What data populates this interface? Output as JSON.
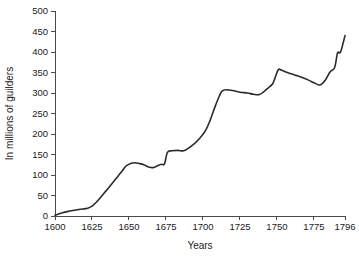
{
  "chart_data": {
    "type": "line",
    "title": "",
    "xlabel": "Years",
    "ylabel": "In millions of guilders",
    "xlim": [
      1600,
      1796
    ],
    "ylim": [
      0,
      500
    ],
    "grid": false,
    "legend": "none",
    "xticks": [
      1600,
      1625,
      1650,
      1675,
      1700,
      1725,
      1750,
      1775,
      1796
    ],
    "xtick_labels": [
      "1600",
      "1625",
      "1650",
      "1675",
      "1700",
      "1725",
      "1750",
      "1775",
      "1796"
    ],
    "yticks": [
      0,
      50,
      100,
      150,
      200,
      250,
      300,
      350,
      400,
      450,
      500
    ],
    "ytick_labels": [
      "0",
      "50",
      "100",
      "150",
      "200",
      "250",
      "300",
      "350",
      "400",
      "450",
      "500"
    ],
    "line_color": "#2b2b2b",
    "background_color": "#ffffff",
    "axis_color": "#4a4a4a",
    "series": [
      {
        "name": "Value",
        "x": [
          1600,
          1605,
          1610,
          1613,
          1616,
          1619,
          1622,
          1625,
          1629,
          1633,
          1637,
          1641,
          1645,
          1648,
          1651,
          1654,
          1657,
          1660,
          1663,
          1666,
          1669,
          1672,
          1674,
          1676,
          1679,
          1683,
          1687,
          1690,
          1694,
          1698,
          1702,
          1705,
          1708,
          1711,
          1713,
          1716,
          1720,
          1725,
          1730,
          1734,
          1738,
          1741,
          1744,
          1747,
          1749,
          1751,
          1753,
          1757,
          1762,
          1767,
          1771,
          1775,
          1778,
          1780,
          1783,
          1786,
          1789,
          1791,
          1793,
          1796
        ],
        "y": [
          2,
          8,
          12,
          14,
          16,
          17,
          19,
          24,
          38,
          55,
          72,
          90,
          108,
          122,
          128,
          130,
          128,
          125,
          120,
          118,
          122,
          126,
          127,
          155,
          159,
          160,
          159,
          165,
          176,
          190,
          210,
          235,
          265,
          292,
          305,
          308,
          306,
          302,
          300,
          297,
          296,
          303,
          312,
          322,
          340,
          357,
          356,
          350,
          344,
          338,
          332,
          325,
          320,
          321,
          333,
          352,
          362,
          398,
          400,
          440
        ]
      }
    ]
  },
  "layout": {
    "plot_left": 55,
    "plot_right": 345,
    "plot_top": 11,
    "plot_bottom": 216
  }
}
